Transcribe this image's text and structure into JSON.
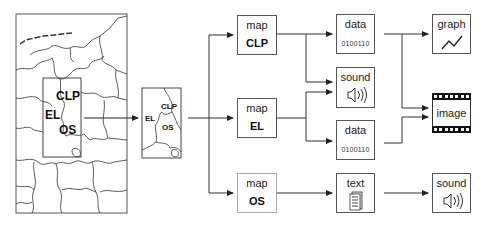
{
  "source_map": {
    "labels": {
      "clp": "CLP",
      "el": "EL",
      "os": "OS"
    }
  },
  "detail_map": {
    "labels": {
      "clp": "CLP",
      "el": "EL",
      "os": "OS"
    }
  },
  "stage1": [
    {
      "id": "map-clp",
      "label": "map",
      "region": "CLP"
    },
    {
      "id": "map-el",
      "label": "map",
      "region": "EL"
    },
    {
      "id": "map-os",
      "label": "map",
      "region": "OS"
    }
  ],
  "stage2": [
    {
      "id": "data-1",
      "label": "data",
      "value": "0100110"
    },
    {
      "id": "sound-1",
      "label": "sound",
      "icon": "speaker-icon"
    },
    {
      "id": "data-2",
      "label": "data",
      "value": "0100110"
    },
    {
      "id": "text-1",
      "label": "text",
      "icon": "document-icon"
    }
  ],
  "stage3": [
    {
      "id": "graph",
      "label": "graph",
      "icon": "line-graph-icon"
    },
    {
      "id": "image",
      "label": "image",
      "icon": "film-strip-icon"
    },
    {
      "id": "sound-2",
      "label": "sound",
      "icon": "speaker-icon"
    }
  ]
}
